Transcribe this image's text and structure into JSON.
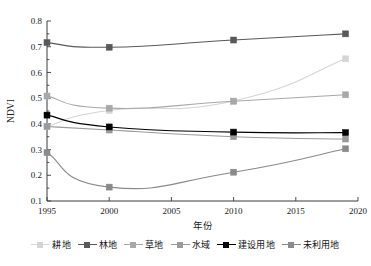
{
  "chart_data": {
    "type": "line",
    "title": "",
    "xlabel": "年份",
    "ylabel": "NDVI",
    "xlim": [
      1995,
      2020
    ],
    "ylim": [
      0.1,
      0.8
    ],
    "xticks": [
      1995,
      2000,
      2005,
      2010,
      2015,
      2020
    ],
    "yticks": [
      "0.1",
      "0.2",
      "0.3",
      "0.4",
      "0.5",
      "0.6",
      "0.7",
      "0.8"
    ],
    "x": [
      1995,
      2000,
      2010,
      2019
    ],
    "grid": false,
    "legend_position": "bottom",
    "marker": "square",
    "series": [
      {
        "name": "耕地",
        "values": [
          0.39,
          0.452,
          0.489,
          0.653
        ],
        "color": "#d5d5d5"
      },
      {
        "name": "林地",
        "values": [
          0.716,
          0.698,
          0.726,
          0.75
        ],
        "color": "#595959"
      },
      {
        "name": "草地",
        "values": [
          0.508,
          0.461,
          0.488,
          0.513
        ],
        "color": "#a8a8a8"
      },
      {
        "name": "水域",
        "values": [
          0.39,
          0.376,
          0.35,
          0.341
        ],
        "color": "#9a9a9a"
      },
      {
        "name": "建设用地",
        "values": [
          0.434,
          0.388,
          0.368,
          0.366
        ],
        "color": "#000000"
      },
      {
        "name": "未利用地",
        "values": [
          0.288,
          0.154,
          0.212,
          0.303
        ],
        "color": "#8a8a8a"
      }
    ]
  },
  "legend": {
    "items": [
      {
        "label": "耕地",
        "color": "#d5d5d5"
      },
      {
        "label": "林地",
        "color": "#595959"
      },
      {
        "label": "草地",
        "color": "#a8a8a8"
      },
      {
        "label": "水域",
        "color": "#9a9a9a"
      },
      {
        "label": "建设用地",
        "color": "#000000"
      },
      {
        "label": "未利用地",
        "color": "#8a8a8a"
      }
    ]
  }
}
